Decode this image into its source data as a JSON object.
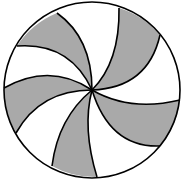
{
  "diagram": {
    "title": "Pinwheel circle",
    "shape": "circle",
    "center": [
      92,
      90
    ],
    "radius": 88,
    "stroke_color": "#000000",
    "fill_shaded": "#a9a9a9",
    "fill_unshaded": "#ffffff",
    "section_count": 10,
    "shaded_count": 5,
    "arcs": [
      {
        "end": [
          57,
          13
        ],
        "ctrl": [
          92,
          38
        ]
      },
      {
        "end": [
          119,
          8
        ],
        "ctrl": [
          120,
          62
        ]
      },
      {
        "end": [
          160,
          35
        ],
        "ctrl": [
          148,
          88
        ]
      },
      {
        "end": [
          180,
          100
        ],
        "ctrl": [
          130,
          112
        ]
      },
      {
        "end": [
          160,
          146
        ],
        "ctrl": [
          110,
          148
        ]
      },
      {
        "end": [
          97,
          177
        ],
        "ctrl": [
          82,
          128
        ]
      },
      {
        "end": [
          52,
          166
        ],
        "ctrl": [
          58,
          118
        ]
      },
      {
        "end": [
          16,
          133
        ],
        "ctrl": [
          40,
          90
        ]
      },
      {
        "end": [
          4,
          88
        ],
        "ctrl": [
          50,
          62
        ]
      },
      {
        "end": [
          17,
          46
        ],
        "ctrl": [
          70,
          42
        ]
      }
    ]
  }
}
